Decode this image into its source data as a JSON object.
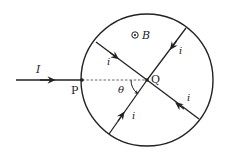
{
  "diagram": {
    "type": "physics-circuit-diagram",
    "colors": {
      "stroke": "#222222",
      "background": "#ffffff"
    },
    "circle": {
      "cx": 147,
      "cy": 80,
      "r": 66
    },
    "labels": {
      "input_current": "I",
      "point_p": "P",
      "point_q": "Q",
      "angle": "θ",
      "magnetic_field": "B",
      "field_symbol": "⊙",
      "branch_current_upper_left": "i",
      "branch_current_upper_right": "i",
      "branch_current_lower_right": "i",
      "branch_current_lower_left": "i"
    },
    "points": {
      "P": [
        82,
        80
      ],
      "Q": [
        147,
        80
      ]
    },
    "wires": [
      {
        "name": "input-wire",
        "from": [
          16,
          80
        ],
        "to": [
          82,
          80
        ],
        "arrow_dir": "right"
      },
      {
        "name": "upper-left-chord",
        "from": [
          96,
          42
        ],
        "to": [
          147,
          80
        ],
        "arrow_dir": "toward-Q"
      },
      {
        "name": "upper-right-chord",
        "from": [
          186,
          28
        ],
        "to": [
          147,
          80
        ],
        "arrow_dir": "toward-Q"
      },
      {
        "name": "lower-right-chord",
        "from": [
          199,
          119
        ],
        "to": [
          147,
          80
        ],
        "arrow_dir": "toward-Q"
      },
      {
        "name": "lower-left-chord",
        "from": [
          109,
          134
        ],
        "to": [
          147,
          80
        ],
        "arrow_dir": "toward-Q"
      }
    ],
    "dashed_line": {
      "from": [
        82,
        80
      ],
      "to": [
        147,
        80
      ]
    }
  }
}
